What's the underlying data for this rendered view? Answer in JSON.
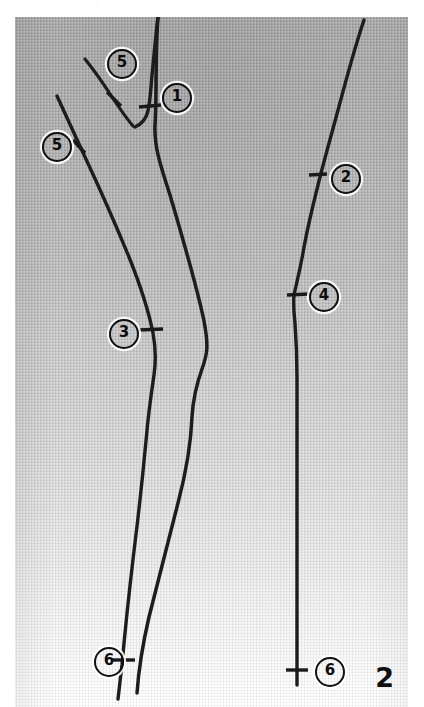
{
  "figure": {
    "panel_id": "2",
    "header_remnant": "· · · · · ·",
    "plate": {
      "x": 15,
      "y": 17,
      "width": 393,
      "height": 690,
      "background_top_color": "#a8a8a8",
      "background_bottom_color": "#ffffff",
      "stroke_color": "#1d1d1d",
      "texture": "woven-canvas-grid"
    }
  },
  "reference_labels": [
    {
      "id": "label-1",
      "text": "1",
      "x": 175,
      "y": 96
    },
    {
      "id": "label-5-top",
      "text": "5",
      "x": 120,
      "y": 62
    },
    {
      "id": "label-5-left",
      "text": "5",
      "x": 55,
      "y": 145
    },
    {
      "id": "label-2",
      "text": "2",
      "x": 344,
      "y": 177
    },
    {
      "id": "label-3",
      "text": "3",
      "x": 122,
      "y": 332
    },
    {
      "id": "label-4",
      "text": "4",
      "x": 322,
      "y": 295
    },
    {
      "id": "label-6-left",
      "text": "6",
      "x": 107,
      "y": 660
    },
    {
      "id": "label-6-right",
      "text": "6",
      "x": 328,
      "y": 670
    }
  ],
  "stems": [
    {
      "id": "stem-main-left",
      "description": "main left stem descending full height, kinked at mid",
      "path": "M 143 0 C 140 40, 142 74, 140 108 C 139 130, 146 150, 155 178 C 168 222, 182 270, 189 304 C 194 330, 192 338, 187 352 C 182 366, 178 382, 177 400 C 176 424, 172 452, 163 486 C 154 520, 144 560, 134 600 C 128 626, 124 648, 122 676",
      "width": 3.5
    },
    {
      "id": "stem-fork-upper",
      "description": "upper stem from top edge down into V junction with label 1",
      "path": "M 143 0 C 141 16, 139 38, 137 58 C 136 72, 135 84, 133 94 C 131 102, 127 107, 120 110",
      "width": 3.4
    },
    {
      "id": "stem-branch-upper-left",
      "description": "short branch from upper-left joining the V junction near label 5-top",
      "path": "M 70 42 C 78 52, 88 66, 97 80 C 105 92, 112 102, 118 109",
      "width": 3.2
    },
    {
      "id": "stem-left-long",
      "description": "long left stem from upper-left running to bottom past labels 5, 3, 6",
      "path": "M 42 79 C 50 96, 60 118, 70 140 C 84 170, 100 206, 114 240 C 126 270, 134 296, 138 316 C 141 332, 141 344, 139 358 C 136 378, 133 400, 131 424 C 128 456, 124 494, 119 534 C 114 576, 110 614, 107 648 C 105 664, 104 674, 103 682",
      "width": 3.4
    },
    {
      "id": "stem-right",
      "description": "right stem from top edge to bottom past labels 2, 4, 6",
      "path": "M 349 3 C 342 24, 334 52, 326 82 C 318 112, 310 140, 304 164 C 298 188, 292 212, 288 236 C 284 258, 281 268, 279 278 C 278 288, 279 296, 280 306 C 281 320, 282 340, 282 362 C 282 392, 282 424, 282 456 C 282 494, 282 532, 282 570 C 282 608, 282 640, 282 668",
      "width": 3.4
    }
  ],
  "tick_marks": [
    {
      "id": "tick-1",
      "x1": 124,
      "y1": 90,
      "x2": 146,
      "y2": 88
    },
    {
      "id": "tick-5-top",
      "x1": 92,
      "y1": 75,
      "x2": 106,
      "y2": 89
    },
    {
      "id": "tick-5-left",
      "x1": 58,
      "y1": 123,
      "x2": 70,
      "y2": 136
    },
    {
      "id": "tick-2",
      "x1": 294,
      "y1": 158,
      "x2": 312,
      "y2": 157
    },
    {
      "id": "tick-3",
      "x1": 124,
      "y1": 313,
      "x2": 148,
      "y2": 312
    },
    {
      "id": "tick-4",
      "x1": 272,
      "y1": 278,
      "x2": 294,
      "y2": 277
    },
    {
      "id": "tick-6-left",
      "x1": 96,
      "y1": 643,
      "x2": 120,
      "y2": 643
    },
    {
      "id": "tick-6-right",
      "x1": 271,
      "y1": 653,
      "x2": 293,
      "y2": 653
    }
  ]
}
